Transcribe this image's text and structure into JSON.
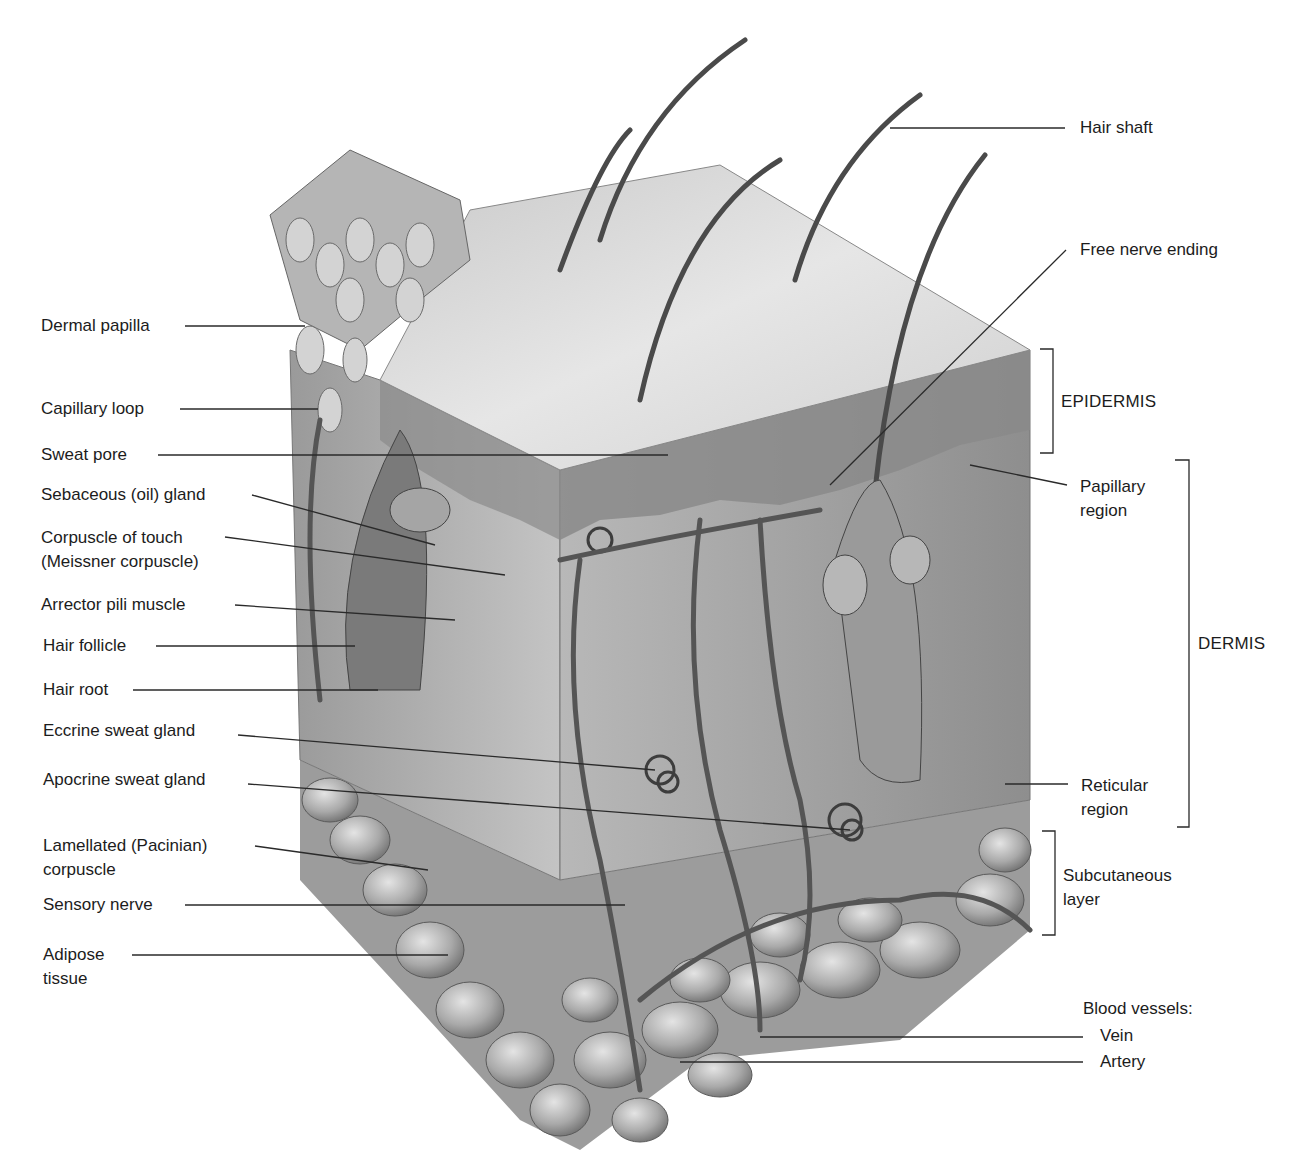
{
  "figure": {
    "colors": {
      "background": "#ffffff",
      "line": "#2a2a2a",
      "text": "#1c1c1c",
      "tissue_light": "#d8d8d8",
      "tissue_mid": "#a8a8a8",
      "tissue_dark": "#6e6e6e"
    }
  },
  "labels_left": [
    {
      "id": "dermal-papilla",
      "text": "Dermal papilla"
    },
    {
      "id": "capillary-loop",
      "text": "Capillary loop"
    },
    {
      "id": "sweat-pore",
      "text": "Sweat pore"
    },
    {
      "id": "sebaceous-gland",
      "text": "Sebaceous (oil) gland"
    },
    {
      "id": "corpuscle-of-touch",
      "text": "Corpuscle of touch\n(Meissner corpuscle)"
    },
    {
      "id": "arrector-pili",
      "text": "Arrector pili muscle"
    },
    {
      "id": "hair-follicle",
      "text": "Hair follicle"
    },
    {
      "id": "hair-root",
      "text": "Hair root"
    },
    {
      "id": "eccrine-sweat-gland",
      "text": "Eccrine sweat gland"
    },
    {
      "id": "apocrine-sweat-gland",
      "text": "Apocrine sweat gland"
    },
    {
      "id": "lamellated-corpuscle",
      "text": "Lamellated (Pacinian)\ncorpuscle"
    },
    {
      "id": "sensory-nerve",
      "text": "Sensory nerve"
    },
    {
      "id": "adipose-tissue",
      "text": "Adipose\ntissue"
    }
  ],
  "labels_right": [
    {
      "id": "hair-shaft",
      "text": "Hair shaft"
    },
    {
      "id": "free-nerve-ending",
      "text": "Free nerve ending"
    },
    {
      "id": "papillary-region",
      "text": "Papillary\nregion"
    },
    {
      "id": "reticular-region",
      "text": "Reticular\nregion"
    },
    {
      "id": "blood-vessels",
      "text": "Blood vessels:"
    },
    {
      "id": "vein",
      "text": "Vein"
    },
    {
      "id": "artery",
      "text": "Artery"
    }
  ],
  "brackets": [
    {
      "id": "epidermis",
      "text": "EPIDERMIS"
    },
    {
      "id": "dermis",
      "text": "DERMIS"
    },
    {
      "id": "subcutaneous",
      "text": "Subcutaneous\nlayer"
    }
  ]
}
